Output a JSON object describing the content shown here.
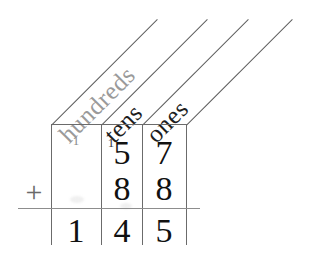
{
  "worksheet": {
    "title": "place-value column addition",
    "operator": "+",
    "columns": [
      {
        "id": "hundreds",
        "label": "hundreds",
        "tone": "light"
      },
      {
        "id": "tens",
        "label": "tens",
        "tone": "dark"
      },
      {
        "id": "ones",
        "label": "ones",
        "tone": "dark"
      }
    ],
    "rows": [
      {
        "id": "addend-1",
        "cells": [
          {
            "column": "hundreds",
            "value": "",
            "carry": "1"
          },
          {
            "column": "tens",
            "value": "5",
            "carry": "1"
          },
          {
            "column": "ones",
            "value": "7",
            "carry": ""
          }
        ]
      },
      {
        "id": "addend-2",
        "cells": [
          {
            "column": "hundreds",
            "value": "",
            "carry": ""
          },
          {
            "column": "tens",
            "value": "8",
            "carry": ""
          },
          {
            "column": "ones",
            "value": "8",
            "carry": ""
          }
        ]
      },
      {
        "id": "sum",
        "cells": [
          {
            "column": "hundreds",
            "value": "1",
            "carry": ""
          },
          {
            "column": "tens",
            "value": "4",
            "carry": ""
          },
          {
            "column": "ones",
            "value": "5",
            "carry": ""
          }
        ]
      }
    ],
    "colors": {
      "ink": "#111111",
      "rule": "#6b6b6b",
      "faint_ink": "#9a9a9a",
      "paper": "#ffffff"
    }
  }
}
